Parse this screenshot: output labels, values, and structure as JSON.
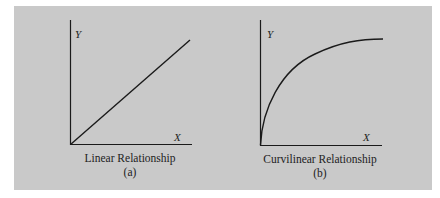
{
  "colors": {
    "panel_bg": "#c9c9c9",
    "ink": "#1a1a1a"
  },
  "figures": [
    {
      "id": "a",
      "y_label": "Y",
      "x_label": "X",
      "caption": "Linear Relationship",
      "sub_label": "(a)"
    },
    {
      "id": "b",
      "y_label": "Y",
      "x_label": "X",
      "caption": "Curvilinear Relationship",
      "sub_label": "(b)"
    }
  ]
}
